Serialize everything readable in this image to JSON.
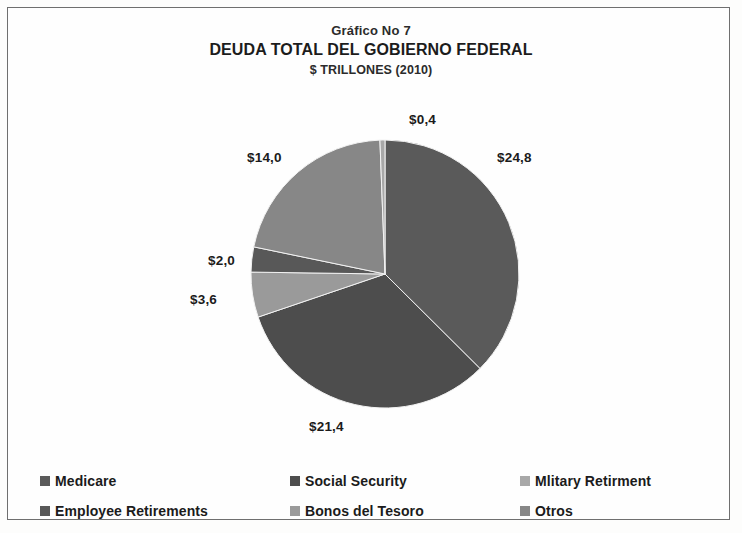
{
  "titles": {
    "superscript": "Gráfico No 7",
    "main": "DEUDA TOTAL DEL GOBIERNO FEDERAL",
    "units": "$ TRILLONES (2010)"
  },
  "labels": {
    "top": "$0,4",
    "upper_right": "$24,8",
    "upper_left": "$14,0",
    "left_upper": "$2,0",
    "left_lower": "$3,6",
    "bottom": "$21,4"
  },
  "legend": {
    "rows": [
      [
        {
          "label": "Medicare",
          "color": "#5a5a5a"
        },
        {
          "label": "Social Security",
          "color": "#4d4d4d"
        },
        {
          "label": "Mlitary Retirment",
          "color": "#a8a8a8"
        }
      ],
      [
        {
          "label": "Employee Retirements",
          "color": "#585858"
        },
        {
          "label": "Bonos del Tesoro",
          "color": "#9a9a9a"
        },
        {
          "label": "Otros",
          "color": "#878787"
        }
      ]
    ]
  },
  "chart_data": {
    "type": "pie",
    "title": "DEUDA TOTAL DEL GOBIERNO FEDERAL",
    "subtitle": "Gráfico No 7",
    "units": "$ TRILLONES (2010)",
    "categories": [
      "Medicare",
      "Social Security",
      "Bonos del Tesoro",
      "Employee Retirements",
      "Otros",
      "Mlitary Retirment"
    ],
    "values": [
      24.8,
      21.4,
      3.6,
      2.0,
      14.0,
      0.4
    ],
    "value_labels": [
      "$24,8",
      "$21,4",
      "$3,6",
      "$2,0",
      "$14,0",
      "$0,4"
    ],
    "colors": [
      "#5a5a5a",
      "#4d4d4d",
      "#9a9a9a",
      "#585858",
      "#878787",
      "#a8a8a8"
    ],
    "total": 66.2,
    "start_angle_deg": 0,
    "direction": "clockwise",
    "legend_position": "bottom",
    "grid": false
  }
}
